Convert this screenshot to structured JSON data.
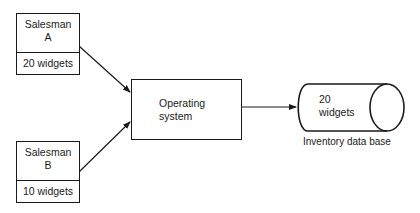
{
  "diagram": {
    "nodes": [
      {
        "id": "salesman_a",
        "title_line1": "Salesman",
        "title_line2": "A",
        "quantity": "20 widgets"
      },
      {
        "id": "salesman_b",
        "title_line1": "Salesman",
        "title_line2": "B",
        "quantity": "10 widgets"
      },
      {
        "id": "operating_system",
        "label_line1": "Operating",
        "label_line2": "system"
      },
      {
        "id": "inventory_db",
        "value_line1": "20",
        "value_line2": "widgets",
        "caption": "Inventory data base"
      }
    ],
    "edges": [
      {
        "from": "salesman_a",
        "to": "operating_system"
      },
      {
        "from": "salesman_b",
        "to": "operating_system"
      },
      {
        "from": "operating_system",
        "to": "inventory_db"
      }
    ]
  }
}
